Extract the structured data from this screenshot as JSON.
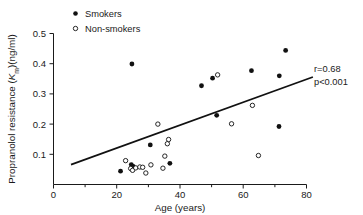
{
  "figure": {
    "background": "#ffffff",
    "ink_color": "#111111"
  },
  "legend": {
    "position": "top-left-inside",
    "items": [
      {
        "label": "Smokers",
        "marker": "filled-circle",
        "color": "#111111"
      },
      {
        "label": "Non-smokers",
        "marker": "open-circle",
        "color": "#111111"
      }
    ]
  },
  "annotations": {
    "correlation": "r=0.68",
    "pvalue": "p<0.001"
  },
  "chart_data": {
    "type": "scatter",
    "title": "",
    "xlabel": "Age (years)",
    "ylabel": "Propranolol resistance (Km)(ng/ml)",
    "ylabel_parts": {
      "prefix": "Propranolol resistance (",
      "italic": "K",
      "subscript": "m",
      "suffix": ")(ng/ml)"
    },
    "xlim": [
      0,
      82
    ],
    "ylim": [
      0,
      0.5
    ],
    "xticks": [
      0,
      20,
      40,
      60,
      80
    ],
    "xticklabels": [
      "0",
      "20",
      "40",
      "60",
      "80"
    ],
    "xminorticks": [
      10,
      30,
      50,
      70
    ],
    "yticks": [
      0.1,
      0.2,
      0.3,
      0.4,
      0.5
    ],
    "yticklabels": [
      "0.1",
      "0.2",
      "0.3",
      "0.4",
      "0.5"
    ],
    "grid": false,
    "legend_position": "top-left",
    "series": [
      {
        "name": "Smokers",
        "marker": "filled-circle",
        "points": [
          [
            21.2,
            0.044
          ],
          [
            24.8,
            0.399
          ],
          [
            24.6,
            0.066
          ],
          [
            25.2,
            0.06
          ],
          [
            30.6,
            0.131
          ],
          [
            36.8,
            0.07
          ],
          [
            46.8,
            0.327
          ],
          [
            50.3,
            0.352
          ],
          [
            51.6,
            0.229
          ],
          [
            62.6,
            0.377
          ],
          [
            71.4,
            0.36
          ],
          [
            71.3,
            0.192
          ],
          [
            73.4,
            0.444
          ]
        ]
      },
      {
        "name": "Non-smokers",
        "marker": "open-circle",
        "points": [
          [
            22.8,
            0.079
          ],
          [
            24.4,
            0.053
          ],
          [
            25.0,
            0.047
          ],
          [
            26.0,
            0.055
          ],
          [
            27.3,
            0.058
          ],
          [
            28.2,
            0.057
          ],
          [
            29.2,
            0.038
          ],
          [
            30.8,
            0.065
          ],
          [
            33.0,
            0.2
          ],
          [
            34.6,
            0.054
          ],
          [
            35.2,
            0.094
          ],
          [
            36.0,
            0.135
          ],
          [
            36.4,
            0.149
          ],
          [
            51.9,
            0.363
          ],
          [
            56.3,
            0.201
          ],
          [
            62.9,
            0.262
          ],
          [
            64.8,
            0.096
          ]
        ]
      }
    ],
    "fit_line": {
      "name": "regression-line",
      "x": [
        18.2,
        82.0
      ],
      "y": [
        0.066,
        0.356
      ]
    }
  }
}
